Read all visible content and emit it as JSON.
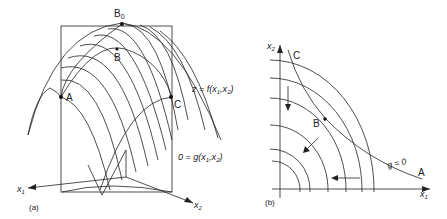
{
  "figure": {
    "panel_a": {
      "caption": "(a)",
      "points": {
        "B0": "B",
        "B0_sub": "0",
        "B": "B",
        "A": "A",
        "C": "C"
      },
      "surface_label": "z = f(x",
      "surface_label_sub1": "1",
      "surface_label_sep": ",x",
      "surface_label_sub2": "2",
      "surface_label_end": ")",
      "constraint_label": "0 = g(x",
      "constraint_label_sub1": "1",
      "constraint_label_sep": ",x",
      "constraint_label_sub2": "2",
      "constraint_label_end": ")",
      "axis_x1": "x",
      "axis_x1_sub": "1",
      "axis_x2": "x",
      "axis_x2_sub": "2"
    },
    "panel_b": {
      "caption": "(b)",
      "axis_x1": "x",
      "axis_x1_sub": "1",
      "axis_x2": "x",
      "axis_x2_sub": "2",
      "points": {
        "A": "A",
        "B": "B",
        "C": "C"
      },
      "constraint_label": "g = 0"
    },
    "colors": {
      "line": "#222222",
      "background": "#ffffff"
    }
  }
}
